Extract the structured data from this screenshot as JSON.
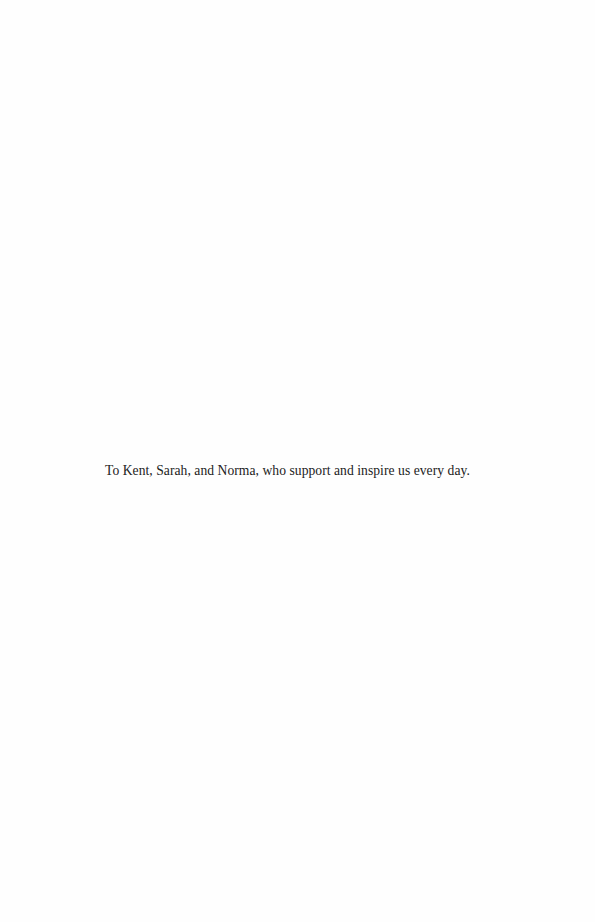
{
  "page": {
    "dedication": "To Kent, Sarah, and Norma, who support and inspire us every day."
  }
}
